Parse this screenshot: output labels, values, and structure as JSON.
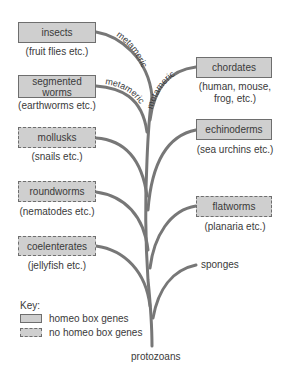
{
  "diagram": {
    "type": "phylogenetic-tree",
    "root": "protozoans",
    "branch_color": "#777777",
    "box_fill": "#cfcfcf",
    "box_border": "#6e6e6e",
    "metameric_label": "metameric",
    "left_groups": [
      {
        "name": "insects",
        "caption": "(fruit flies etc.)",
        "homeo_box": true,
        "metameric": true
      },
      {
        "name": "segmented worms",
        "caption": "(earthworms etc.)",
        "homeo_box": true,
        "metameric": true
      },
      {
        "name": "mollusks",
        "caption": "(snails etc.)",
        "homeo_box": false
      },
      {
        "name": "roundworms",
        "caption": "(nematodes etc.)",
        "homeo_box": false
      },
      {
        "name": "coelenterates",
        "caption": "(jellyfish etc.)",
        "homeo_box": false
      }
    ],
    "right_groups": [
      {
        "name": "chordates",
        "caption_line1": "(human, mouse,",
        "caption_line2": "frog, etc.)",
        "homeo_box": true,
        "metameric": true
      },
      {
        "name": "echinoderms",
        "caption": "(sea urchins etc.)",
        "homeo_box": true
      },
      {
        "name": "flatworms",
        "caption": "(planaria etc.)",
        "homeo_box": false
      }
    ],
    "unboxed": {
      "sponges": "sponges",
      "protozoans": "protozoans"
    }
  },
  "key": {
    "title": "Key:",
    "items": [
      {
        "style": "solid",
        "label": "homeo box genes"
      },
      {
        "style": "dashed",
        "label": "no homeo box genes"
      }
    ]
  }
}
